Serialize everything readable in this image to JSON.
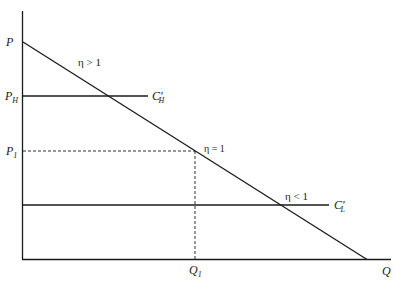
{
  "diagram": {
    "type": "demand-elasticity",
    "axes": {
      "y_label": "P",
      "x_label": "Q"
    },
    "price_levels": [
      {
        "label": "P",
        "sub": ""
      },
      {
        "label": "P",
        "sub": "H"
      },
      {
        "label": "P",
        "sub": "1"
      }
    ],
    "quantity_levels": [
      {
        "label": "Q",
        "sub": "1"
      }
    ],
    "cost_lines": [
      {
        "label": "C'",
        "sub": "H"
      },
      {
        "label": "C'",
        "sub": "L"
      }
    ],
    "elasticity_labels": [
      {
        "text": "η > 1"
      },
      {
        "text": "η = 1"
      },
      {
        "text": "η < 1"
      }
    ],
    "colors": {
      "line": "#1a1a1a",
      "background": "#ffffff"
    }
  }
}
